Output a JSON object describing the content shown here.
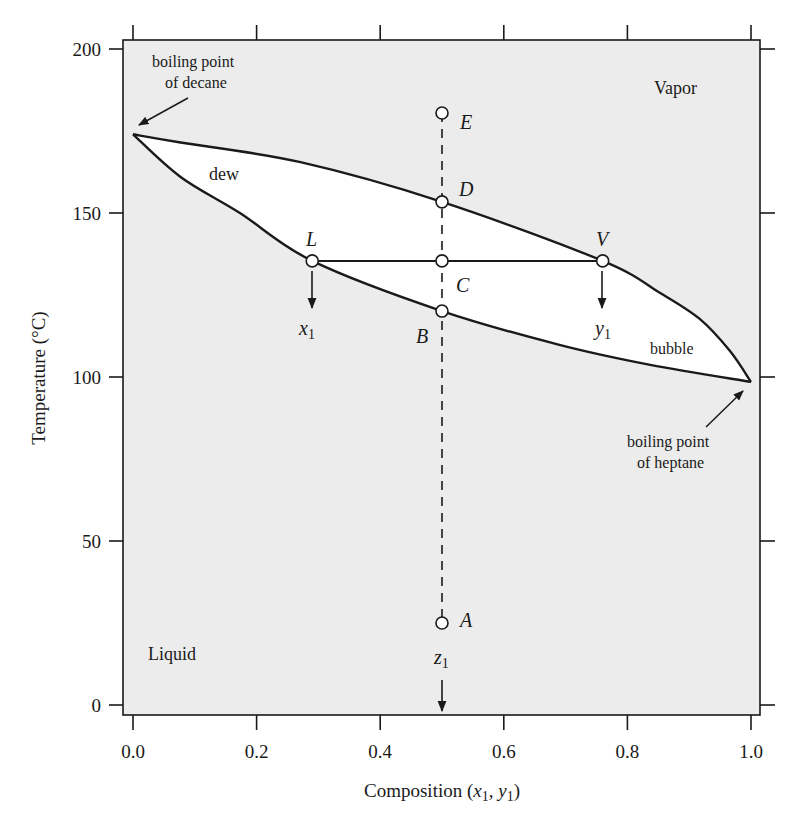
{
  "chart_data": {
    "type": "line",
    "title": "",
    "xlabel": "Composition (x1, y1)",
    "ylabel": "Temperature (°C)",
    "xlim": [
      0.0,
      1.0
    ],
    "ylim": [
      0,
      200
    ],
    "x_ticks": [
      "0.0",
      "0.2",
      "0.4",
      "0.6",
      "0.8",
      "1.0"
    ],
    "y_ticks": [
      "0",
      "50",
      "100",
      "150",
      "200"
    ],
    "grid": false,
    "legend": null,
    "series": [
      {
        "name": "dew",
        "points": [
          [
            0.0,
            174
          ],
          [
            0.077,
            171.5
          ],
          [
            0.271,
            165.5
          ],
          [
            0.5,
            153.4
          ],
          [
            0.76,
            135.4
          ],
          [
            0.853,
            125.6
          ],
          [
            0.917,
            117.7
          ],
          [
            0.966,
            107.9
          ],
          [
            1.0,
            98.5
          ]
        ]
      },
      {
        "name": "bubble",
        "points": [
          [
            0.0,
            174
          ],
          [
            0.077,
            161.0
          ],
          [
            0.173,
            150.0
          ],
          [
            0.29,
            135.4
          ],
          [
            0.5,
            120.1
          ],
          [
            0.69,
            109.8
          ],
          [
            0.837,
            103.7
          ],
          [
            1.0,
            98.5
          ]
        ]
      }
    ],
    "tie_line": {
      "x": [
        0.29,
        0.76
      ],
      "T": 135.4
    },
    "feed_line": {
      "x": 0.5,
      "T_from": 180.5,
      "T_to": 0,
      "style": "dashed"
    },
    "points": [
      {
        "label": "E",
        "x": 0.5,
        "T": 180.5
      },
      {
        "label": "D",
        "x": 0.5,
        "T": 153.4
      },
      {
        "label": "C",
        "x": 0.5,
        "T": 135.4
      },
      {
        "label": "B",
        "x": 0.5,
        "T": 120.1
      },
      {
        "label": "A",
        "x": 0.5,
        "T": 25
      },
      {
        "label": "L",
        "x": 0.29,
        "T": 135.4
      },
      {
        "label": "V",
        "x": 0.76,
        "T": 135.4
      }
    ],
    "annotations": [
      {
        "text": "boiling point of decane",
        "x": 0.0,
        "T": 174
      },
      {
        "text": "boiling point of heptane",
        "x": 1.0,
        "T": 98.5
      },
      {
        "text": "dew",
        "region": "upper-left of two-phase envelope"
      },
      {
        "text": "bubble",
        "region": "lower-right of two-phase envelope"
      },
      {
        "text": "Vapor",
        "region": "top-right"
      },
      {
        "text": "Liquid",
        "region": "bottom-left"
      },
      {
        "text": "x1",
        "arrow_from": "L"
      },
      {
        "text": "y1",
        "arrow_from": "V"
      },
      {
        "text": "z1",
        "arrow_from": "A"
      }
    ]
  },
  "labels": {
    "ylabel": "Temperature (°C)",
    "xlabel_main": "Composition (",
    "xlabel_x": "x",
    "xlabel_sep": ", ",
    "xlabel_y": "y",
    "xlabel_sub": "1",
    "xlabel_close": ")",
    "vapor": "Vapor",
    "liquid": "Liquid",
    "dew": "dew",
    "bubble": "bubble",
    "decane_line1": "boiling point",
    "decane_line2": "of decane",
    "heptane_line1": "boiling point",
    "heptane_line2": "of heptane",
    "x1_var": "x",
    "y1_var": "y",
    "z1_var": "z",
    "subscript": "1",
    "pt_E": "E",
    "pt_D": "D",
    "pt_C": "C",
    "pt_B": "B",
    "pt_A": "A",
    "pt_L": "L",
    "pt_V": "V"
  },
  "colors": {
    "plot_bg": "#ececec",
    "envelope_fill": "#ffffff",
    "ink": "#1a1a1a"
  }
}
